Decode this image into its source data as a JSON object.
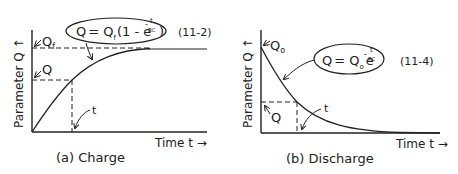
{
  "panels": [
    {
      "id": "charge",
      "caption": "(a) Charge",
      "ylabel": "Parameter Q",
      "xlabel": "Time t",
      "equation": {
        "lhs": "Q",
        "rhs_main": "= Q",
        "subscript": "f",
        "paren_open": "(1 - e",
        "exponent_num": "t",
        "exponent_den": "RC",
        "exponent_sign": "-",
        "paren_close": ")"
      },
      "equation_number": "(11-2)",
      "labels": {
        "final": "Q",
        "final_sub": "f",
        "q": "Q",
        "t": "t"
      }
    },
    {
      "id": "discharge",
      "caption": "(b) Discharge",
      "ylabel": "Parameter Q",
      "xlabel": "Time t",
      "equation": {
        "lhs": "Q",
        "rhs_main": "= Q",
        "subscript": "o",
        "base": "e",
        "exponent_num": "t",
        "exponent_den": "RC",
        "exponent_sign": "-"
      },
      "equation_number": "(11-4)",
      "labels": {
        "initial": "Q",
        "initial_sub": "o",
        "q": "Q",
        "t": "t"
      }
    }
  ],
  "colors": {
    "ink": "#222222",
    "background": "#ffffff"
  }
}
